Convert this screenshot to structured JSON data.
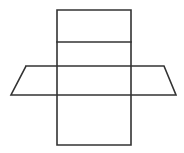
{
  "figure": {
    "background_color": "#ffffff",
    "stroke_color": "#333333",
    "stroke_width": 1.6,
    "canvas": {
      "width": 184,
      "height": 153
    },
    "shapes": [
      {
        "name": "vertical-rectangle",
        "type": "rectangle",
        "description": "Tall upright rectangle forming the vertical band of the net",
        "x": 57,
        "y": 10,
        "width": 74,
        "height": 135,
        "points": "57,10 131,10 131,145 57,145 57,10"
      },
      {
        "name": "upper-divider-line",
        "type": "line",
        "description": "Horizontal fold line across the upper part of the rectangle",
        "x1": 57,
        "y1": 42,
        "x2": 131,
        "y2": 42
      },
      {
        "name": "parallelogram",
        "type": "parallelogram",
        "description": "Slanted parallelogram crossing the rectangle horizontally",
        "points": "26,66 164,66 176,95 11,95 26,66",
        "vertices": [
          {
            "label": "top-left",
            "x": 26,
            "y": 66
          },
          {
            "label": "top-right",
            "x": 164,
            "y": 66
          },
          {
            "label": "bottom-right",
            "x": 176,
            "y": 95
          },
          {
            "label": "bottom-left",
            "x": 11,
            "y": 95
          }
        ]
      }
    ],
    "labels": []
  }
}
